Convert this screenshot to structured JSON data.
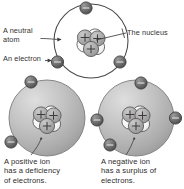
{
  "figure": {
    "background_color": "#ffffff",
    "ink_color": "#3a3738",
    "sphere_fill": "#b9b9b9",
    "electron_fill": "#6e6e6e",
    "proton_fill": "#a8a8a8",
    "neutron_fill": "#f2f2f2",
    "proton_symbol": "+",
    "electron_symbol": "–"
  },
  "labels": {
    "neutral_atom": "A neutral\natom",
    "an_electron": "An electron",
    "the_nucleus": "The nucleus"
  },
  "captions": {
    "positive_ion": "A positive ion\nhas a deficiency\nof electrons.",
    "negative_ion": "A negative ion\nhas a surplus of\nelectrons."
  },
  "diagrams": [
    {
      "id": "neutral-atom",
      "name": "neutral atom",
      "style": "orbit-ring",
      "center": [
        91,
        41
      ],
      "radius": 37,
      "electron_count": 3,
      "electron_angles_deg": [
        268,
        35,
        145
      ],
      "proton_count": 3,
      "neutron_count": 3
    },
    {
      "id": "positive-ion",
      "name": "positive ion",
      "style": "filled-sphere",
      "center": [
        47,
        118
      ],
      "radius": 38,
      "electron_count": 2,
      "electron_angles_deg": [
        285,
        160
      ],
      "proton_count": 3,
      "neutron_count": 3
    },
    {
      "id": "negative-ion",
      "name": "negative ion",
      "style": "filled-sphere",
      "center": [
        136,
        118
      ],
      "radius": 38,
      "electron_count": 4,
      "electron_angles_deg": [
        280,
        0,
        180,
        145
      ],
      "proton_count": 3,
      "neutron_count": 3
    }
  ]
}
